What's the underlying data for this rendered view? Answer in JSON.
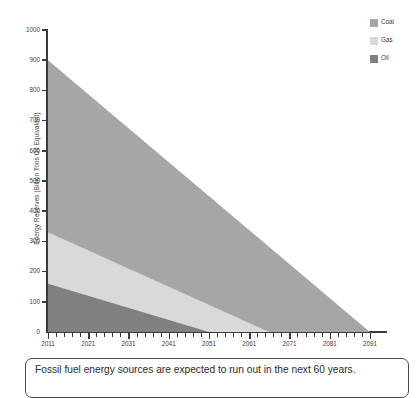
{
  "chart_data": {
    "type": "area",
    "title": "",
    "subtitle": "",
    "xlabel": "",
    "ylabel": "Energy Reserves (Billion Tons Oil Equivalent)",
    "xlim": [
      2011,
      2095
    ],
    "ylim": [
      0,
      1000
    ],
    "grid": false,
    "stacked": true,
    "legend_position": "top-right",
    "x_tick_labels": [
      "2011",
      "2021",
      "2031",
      "2041",
      "2051",
      "2061",
      "2071",
      "2081",
      "2091"
    ],
    "x_tick_values": [
      2011,
      2021,
      2031,
      2041,
      2051,
      2061,
      2071,
      2081,
      2091
    ],
    "x_minor_tick_step": 2,
    "y_tick_labels": [
      "0",
      "100",
      "200",
      "300",
      "400",
      "500",
      "600",
      "700",
      "800",
      "900",
      "1000"
    ],
    "y_tick_values": [
      0,
      100,
      200,
      300,
      400,
      500,
      600,
      700,
      800,
      900,
      1000
    ],
    "series": [
      {
        "name": "Oil",
        "color": "#808080",
        "stack_order": 1,
        "x": [
          2011,
          2051
        ],
        "values": [
          160,
          0
        ]
      },
      {
        "name": "Gas",
        "color": "#d9d9d9",
        "stack_order": 2,
        "x": [
          2011,
          2066
        ],
        "values": [
          170,
          0
        ]
      },
      {
        "name": "Coal",
        "color": "#a6a6a6",
        "stack_order": 3,
        "x": [
          2011,
          2091
        ],
        "values": [
          570,
          0
        ]
      }
    ],
    "cumulative_top_boundaries": {
      "oil_top": {
        "x": [
          2011,
          2051
        ],
        "y": [
          160,
          0
        ]
      },
      "gas_top": {
        "x": [
          2011,
          2066
        ],
        "y": [
          330,
          0
        ]
      },
      "coal_top": {
        "x": [
          2011,
          2091
        ],
        "y": [
          900,
          0
        ]
      }
    },
    "annotations": []
  },
  "legend": {
    "items": [
      {
        "label": "Coal",
        "color": "#a6a6a6"
      },
      {
        "label": "Gas",
        "color": "#d9d9d9"
      },
      {
        "label": "Oil",
        "color": "#808080"
      }
    ]
  },
  "caption": {
    "text": "Fossil fuel energy sources are expected to run out in the next 60 years."
  },
  "colors": {
    "axis": "#3b3b3b",
    "text": "#3b3b3b",
    "caption_border": "#4a4a4a",
    "background": "#ffffff"
  }
}
